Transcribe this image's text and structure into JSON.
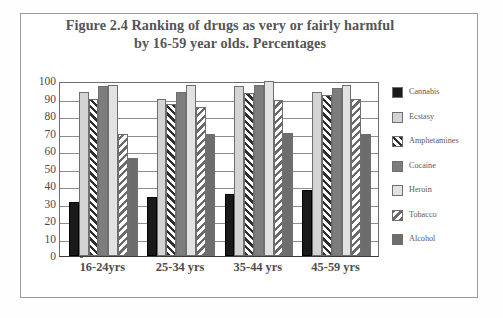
{
  "chart_data": {
    "type": "bar",
    "title": "Figure 2.4 Ranking of drugs as very or fairly harmful by 16-59 year olds. Percentages",
    "title_line1": "Figure 2.4 Ranking of drugs as very or fairly harmful",
    "title_line2": "by 16-59 year olds. Percentages",
    "xlabel": "",
    "ylabel": "",
    "ylim": [
      0,
      100
    ],
    "ytick_step": 10,
    "grid": true,
    "legend_position": "right",
    "categories": [
      "16-24yrs",
      "25-34 yrs",
      "35-44 yrs",
      "45-59 yrs"
    ],
    "ytick_labels": [
      "100",
      "90",
      "80",
      "70",
      "60",
      "50",
      "40",
      "30",
      "20",
      "10",
      "0"
    ],
    "series": [
      {
        "name": "Cannabis",
        "key": "cannabis",
        "color": "#1a1a1a",
        "fill": "solid",
        "values": [
          31,
          34,
          35.5,
          37.5
        ]
      },
      {
        "name": "Ecstasy",
        "key": "ecstasy",
        "color": "#d4d4d4",
        "fill": "solid",
        "values": [
          94,
          90,
          97,
          94
        ]
      },
      {
        "name": "Amphetamines",
        "key": "amphetamines",
        "color": "#2e2e2e",
        "fill": "diagonal-up",
        "values": [
          90,
          87,
          93,
          92
        ]
      },
      {
        "name": "Cocaine",
        "key": "cocaine",
        "color": "#7d7d7d",
        "fill": "solid",
        "values": [
          97,
          94,
          98,
          96
        ]
      },
      {
        "name": "Heroin",
        "key": "heroin",
        "color": "#e2e2e2",
        "fill": "solid",
        "values": [
          98,
          98,
          100,
          98
        ]
      },
      {
        "name": "Tobacco",
        "key": "tobacco",
        "color": "#6a6a6a",
        "fill": "diagonal-down",
        "values": [
          70,
          85,
          89,
          90
        ]
      },
      {
        "name": "Alcohol",
        "key": "alcohol",
        "color": "#6d6d6d",
        "fill": "solid",
        "values": [
          56,
          69.5,
          70.5,
          70
        ]
      }
    ]
  },
  "legend": {
    "items": [
      {
        "label": "Cannabis"
      },
      {
        "label": "Ecstasy"
      },
      {
        "label": "Amphetamines"
      },
      {
        "label": "Cocaine"
      },
      {
        "label": "Heroin"
      },
      {
        "label": "Tobacco"
      },
      {
        "label": "Alcohol"
      }
    ]
  }
}
